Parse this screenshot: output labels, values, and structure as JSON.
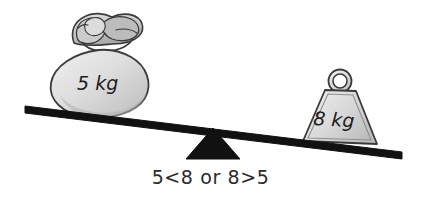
{
  "illustration": {
    "title": "Balance scale comparing 5 kg and 8 kg",
    "caption": "5<8 or 8>5",
    "left_object": {
      "type": "sack",
      "label": "5 kg",
      "value": 5,
      "unit": "kg",
      "side": "left",
      "position": "raised"
    },
    "right_object": {
      "type": "weight",
      "label": "8 kg",
      "value": 8,
      "unit": "kg",
      "side": "right",
      "position": "lowered"
    },
    "fulcrum": {
      "shape": "triangle",
      "color": "#111111"
    },
    "beam": {
      "color": "#111111",
      "tilt": "right-down"
    },
    "colors": {
      "background": "#ffffff",
      "outline": "#3a3a3a",
      "fill_light": "#e9e9e9",
      "fill_mid": "#cfcfcf",
      "fill_dark": "#a8a8a8",
      "text": "#1d1d1d"
    }
  }
}
